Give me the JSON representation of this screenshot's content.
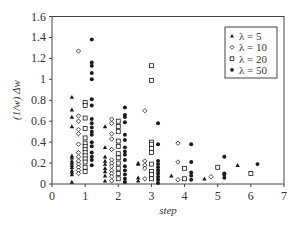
{
  "chart_data": {
    "type": "scatter",
    "title": "",
    "xlabel": "step",
    "ylabel": "(1/w) Δw",
    "xlim": [
      0,
      7
    ],
    "ylim": [
      0,
      1.6
    ],
    "xticks": [
      "0",
      "1",
      "2",
      "3",
      "4",
      "5",
      "6",
      "7"
    ],
    "yticks": [
      "0",
      "0.2",
      "0.4",
      "0.6",
      "0.8",
      "1",
      "1.2",
      "1.4",
      "1.6"
    ],
    "grid": false,
    "legend_position": "upper right",
    "series": [
      {
        "name": "λ = 5",
        "marker": "triangle",
        "points": [
          [
            0.6,
            0.83
          ],
          [
            0.6,
            0.71
          ],
          [
            0.6,
            0.64
          ],
          [
            0.6,
            0.55
          ],
          [
            0.6,
            0.27
          ],
          [
            0.6,
            0.25
          ],
          [
            0.6,
            0.22
          ],
          [
            0.6,
            0.2
          ],
          [
            0.6,
            0.18
          ],
          [
            0.6,
            0.16
          ],
          [
            0.6,
            0.13
          ],
          [
            0.6,
            0.11
          ],
          [
            0.6,
            0.09
          ],
          [
            0.6,
            0.02
          ],
          [
            1.6,
            0.55
          ],
          [
            1.6,
            0.35
          ],
          [
            1.6,
            0.26
          ],
          [
            1.6,
            0.22
          ],
          [
            1.6,
            0.19
          ],
          [
            1.6,
            0.15
          ],
          [
            1.6,
            0.12
          ],
          [
            1.6,
            0.08
          ],
          [
            1.6,
            0.03
          ],
          [
            2.6,
            0.2
          ],
          [
            2.6,
            0.19
          ],
          [
            2.6,
            0.06
          ],
          [
            2.6,
            0.03
          ],
          [
            3.6,
            0.08
          ],
          [
            4.6,
            0.05
          ],
          [
            5.6,
            0.18
          ]
        ]
      },
      {
        "name": "λ = 10",
        "marker": "diamond-open",
        "points": [
          [
            0.8,
            1.27
          ],
          [
            0.8,
            0.65
          ],
          [
            0.8,
            0.6
          ],
          [
            0.8,
            0.52
          ],
          [
            0.8,
            0.48
          ],
          [
            0.8,
            0.38
          ],
          [
            0.8,
            0.3
          ],
          [
            0.8,
            0.26
          ],
          [
            0.8,
            0.22
          ],
          [
            0.8,
            0.19
          ],
          [
            0.8,
            0.16
          ],
          [
            0.8,
            0.13
          ],
          [
            0.8,
            0.1
          ],
          [
            1.8,
            0.62
          ],
          [
            1.8,
            0.58
          ],
          [
            1.8,
            0.48
          ],
          [
            1.8,
            0.43
          ],
          [
            1.8,
            0.33
          ],
          [
            1.8,
            0.23
          ],
          [
            1.8,
            0.2
          ],
          [
            1.8,
            0.17
          ],
          [
            1.8,
            0.13
          ],
          [
            1.8,
            0.1
          ],
          [
            1.8,
            0.07
          ],
          [
            1.8,
            0.03
          ],
          [
            2.8,
            0.7
          ],
          [
            2.8,
            0.22
          ],
          [
            2.8,
            0.18
          ],
          [
            2.8,
            0.15
          ],
          [
            2.8,
            0.05
          ],
          [
            3.8,
            0.39
          ],
          [
            3.8,
            0.21
          ],
          [
            3.8,
            0.04
          ],
          [
            4.8,
            0.07
          ]
        ]
      },
      {
        "name": "λ = 20",
        "marker": "square-open",
        "points": [
          [
            1.0,
            0.78
          ],
          [
            1.0,
            0.75
          ],
          [
            1.0,
            0.63
          ],
          [
            1.0,
            0.53
          ],
          [
            1.0,
            0.44
          ],
          [
            1.0,
            0.39
          ],
          [
            1.0,
            0.36
          ],
          [
            1.0,
            0.33
          ],
          [
            1.0,
            0.3
          ],
          [
            1.0,
            0.27
          ],
          [
            1.0,
            0.24
          ],
          [
            1.0,
            0.21
          ],
          [
            1.0,
            0.16
          ],
          [
            1.0,
            0.12
          ],
          [
            2.0,
            0.6
          ],
          [
            2.0,
            0.55
          ],
          [
            2.0,
            0.5
          ],
          [
            2.0,
            0.41
          ],
          [
            2.0,
            0.36
          ],
          [
            2.0,
            0.29
          ],
          [
            2.0,
            0.25
          ],
          [
            2.0,
            0.2
          ],
          [
            2.0,
            0.15
          ],
          [
            2.0,
            0.1
          ],
          [
            2.0,
            0.05
          ],
          [
            3.0,
            1.13
          ],
          [
            3.0,
            0.99
          ],
          [
            3.0,
            0.4
          ],
          [
            3.0,
            0.38
          ],
          [
            3.0,
            0.34
          ],
          [
            3.0,
            0.3
          ],
          [
            3.0,
            0.19
          ],
          [
            3.0,
            0.12
          ],
          [
            3.0,
            0.09
          ],
          [
            3.0,
            0.05
          ],
          [
            4.0,
            0.15
          ],
          [
            4.0,
            0.05
          ],
          [
            5.0,
            0.16
          ],
          [
            6.0,
            0.1
          ]
        ]
      },
      {
        "name": "λ = 50",
        "marker": "circle-filled",
        "points": [
          [
            1.2,
            1.38
          ],
          [
            1.2,
            1.16
          ],
          [
            1.2,
            1.13
          ],
          [
            1.2,
            1.06
          ],
          [
            1.2,
            1.0
          ],
          [
            1.2,
            0.81
          ],
          [
            1.2,
            0.75
          ],
          [
            1.2,
            0.62
          ],
          [
            1.2,
            0.58
          ],
          [
            1.2,
            0.54
          ],
          [
            1.2,
            0.5
          ],
          [
            1.2,
            0.47
          ],
          [
            1.2,
            0.4
          ],
          [
            1.2,
            0.36
          ],
          [
            1.2,
            0.3
          ],
          [
            1.2,
            0.26
          ],
          [
            1.2,
            0.23
          ],
          [
            1.2,
            0.18
          ],
          [
            2.2,
            0.73
          ],
          [
            2.2,
            0.66
          ],
          [
            2.2,
            0.64
          ],
          [
            2.2,
            0.59
          ],
          [
            2.2,
            0.47
          ],
          [
            2.2,
            0.42
          ],
          [
            2.2,
            0.35
          ],
          [
            2.2,
            0.31
          ],
          [
            2.2,
            0.28
          ],
          [
            2.2,
            0.23
          ],
          [
            2.2,
            0.17
          ],
          [
            2.2,
            0.13
          ],
          [
            2.2,
            0.09
          ],
          [
            2.2,
            0.05
          ],
          [
            2.2,
            0.02
          ],
          [
            3.2,
            0.58
          ],
          [
            3.2,
            0.38
          ],
          [
            3.2,
            0.22
          ],
          [
            3.2,
            0.19
          ],
          [
            3.2,
            0.16
          ],
          [
            3.2,
            0.13
          ],
          [
            3.2,
            0.1
          ],
          [
            3.2,
            0.07
          ],
          [
            3.2,
            0.04
          ],
          [
            3.2,
            0.01
          ],
          [
            4.2,
            0.38
          ],
          [
            4.2,
            0.21
          ],
          [
            4.2,
            0.11
          ],
          [
            4.2,
            0.08
          ],
          [
            4.2,
            0.04
          ],
          [
            5.2,
            0.26
          ],
          [
            5.2,
            0.1
          ],
          [
            5.2,
            0.09
          ],
          [
            5.2,
            0.06
          ],
          [
            6.2,
            0.19
          ]
        ]
      }
    ]
  },
  "colors": {
    "axis": "#444444",
    "marker": "#1a1a1a",
    "text": "#333333",
    "background": "#ffffff"
  }
}
